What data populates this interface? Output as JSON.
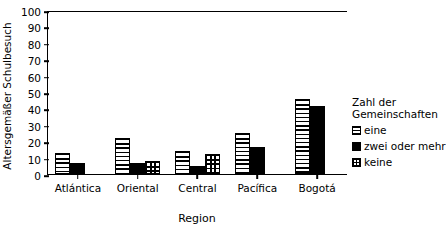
{
  "chart_data": {
    "type": "bar",
    "title": "",
    "title_remnant": "(cropped)",
    "xlabel": "Region",
    "ylabel": "Altersgemäßer Schulbesuch",
    "categories": [
      "Atlántica",
      "Oriental",
      "Central",
      "Pacífica",
      "Bogotá"
    ],
    "series": [
      {
        "name": "eine",
        "pattern": "horizontal-stripes",
        "values": [
          13,
          22,
          14,
          25,
          46
        ]
      },
      {
        "name": "zwei oder mehr",
        "pattern": "solid-black",
        "values": [
          7,
          7,
          5,
          16.5,
          41.5
        ]
      },
      {
        "name": "keine",
        "pattern": "cross-hatch-grid",
        "values": [
          null,
          8,
          12,
          null,
          null
        ]
      }
    ],
    "ylim": [
      0,
      100
    ],
    "yticks": [
      0,
      10,
      20,
      30,
      40,
      50,
      60,
      70,
      80,
      90,
      100
    ],
    "ytick_labels": [
      "0",
      "10",
      "20",
      "30",
      "40",
      "50",
      "60",
      "70",
      "80",
      "90",
      "100"
    ],
    "grid": false,
    "legend_position": "right",
    "legend_title_lines": [
      "Zahl der",
      "Gemeinschaften"
    ]
  },
  "legend": {
    "title_line1": "Zahl der",
    "title_line2": "Gemeinschaften",
    "items": [
      {
        "label": "eine"
      },
      {
        "label": "zwei oder mehr"
      },
      {
        "label": "keine"
      }
    ]
  },
  "colors": {
    "axis": "#000000",
    "bar_fill_solid": "#000000",
    "background": "#ffffff"
  }
}
